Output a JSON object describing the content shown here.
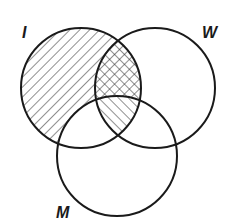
{
  "diagram": {
    "type": "venn",
    "sets": [
      {
        "id": "I",
        "label": "I",
        "cx": 81,
        "cy": 88,
        "r": 60
      },
      {
        "id": "W",
        "label": "W",
        "cx": 155,
        "cy": 88,
        "r": 60
      },
      {
        "id": "M",
        "label": "M",
        "cx": 117,
        "cy": 156,
        "r": 60
      }
    ],
    "regions": [
      {
        "name": "I only",
        "shading": "back-diagonal hatch"
      },
      {
        "name": "I and W, not M",
        "shading": "cross-hatch"
      },
      {
        "name": "I and W and M",
        "shading": "forward-diagonal hatch"
      },
      {
        "name": "I and M, not W",
        "shading": "none"
      },
      {
        "name": "W only",
        "shading": "none"
      },
      {
        "name": "M only",
        "shading": "none"
      },
      {
        "name": "W and M, not I",
        "shading": "none"
      }
    ],
    "colors": {
      "stroke": "#1a1a1a",
      "background": "#ffffff"
    }
  },
  "labels": {
    "I": "I",
    "W": "W",
    "M": "M"
  }
}
